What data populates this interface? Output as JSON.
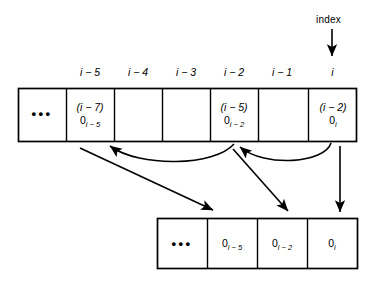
{
  "diagram": {
    "index_pointer": {
      "label": "index"
    },
    "top_array": {
      "column_headers": [
        "i − 5",
        "i − 4",
        "i − 3",
        "i − 2",
        "i − 1",
        "i"
      ],
      "cells": [
        {
          "kind": "ellipsis",
          "dots": "•••",
          "line1": "",
          "line2_base": "",
          "line2_sub": ""
        },
        {
          "kind": "filled",
          "dots": "",
          "line1": "(i − 7)",
          "line2_base": "0",
          "line2_sub": "i − 5"
        },
        {
          "kind": "empty",
          "dots": "",
          "line1": "",
          "line2_base": "",
          "line2_sub": ""
        },
        {
          "kind": "empty",
          "dots": "",
          "line1": "",
          "line2_base": "",
          "line2_sub": ""
        },
        {
          "kind": "filled",
          "dots": "",
          "line1": "(i − 5)",
          "line2_base": "0",
          "line2_sub": "i − 2"
        },
        {
          "kind": "empty",
          "dots": "",
          "line1": "",
          "line2_base": "",
          "line2_sub": ""
        },
        {
          "kind": "filled",
          "dots": "",
          "line1": "(i − 2)",
          "line2_base": "0",
          "line2_sub": "i"
        }
      ]
    },
    "lower_array": {
      "cells": [
        {
          "kind": "ellipsis",
          "dots": "•••",
          "base": "",
          "sub": ""
        },
        {
          "kind": "filled",
          "dots": "",
          "base": "0",
          "sub": "i − 5"
        },
        {
          "kind": "filled",
          "dots": "",
          "base": "0",
          "sub": "i − 2"
        },
        {
          "kind": "filled",
          "dots": "",
          "base": "0",
          "sub": "i"
        }
      ]
    },
    "colors": {
      "stroke": "#000000",
      "background": "#ffffff",
      "text": "#000000"
    }
  }
}
